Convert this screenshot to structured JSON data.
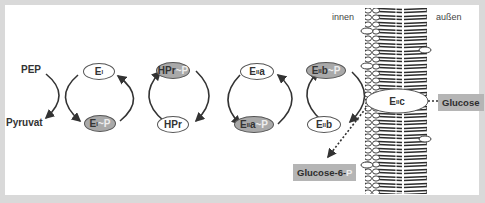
{
  "diagram": {
    "colors": {
      "frame": "#d9d9d9",
      "panel": "#ffffff",
      "phosphorylated_node": "#a9a9a9",
      "label_box": "#b5b5b5",
      "arrow": "#333333",
      "membrane": "#2b2b2b"
    },
    "substrates": {
      "pep": "PEP",
      "pyruvat": "Pyruvat"
    },
    "sides": {
      "inside": "innen",
      "outside": "außen"
    },
    "nodes": {
      "ei": {
        "base": "E",
        "sub": "I",
        "suffix": "",
        "p": ""
      },
      "ei_p": {
        "base": "E",
        "sub": "I",
        "suffix": "",
        "p": "~P"
      },
      "hpr_p": {
        "base": "HPr",
        "sub": "",
        "suffix": "",
        "p": "~P"
      },
      "hpr": {
        "base": "HPr",
        "sub": "",
        "suffix": "",
        "p": ""
      },
      "eiia": {
        "base": "E",
        "sub": "II",
        "suffix": "a",
        "p": ""
      },
      "eiia_p": {
        "base": "E",
        "sub": "II",
        "suffix": "a",
        "p": "~P"
      },
      "eiib_p": {
        "base": "E",
        "sub": "II",
        "suffix": "b",
        "p": "~P"
      },
      "eiib": {
        "base": "E",
        "sub": "II",
        "suffix": "b",
        "p": ""
      },
      "eiic": {
        "base": "E",
        "sub": "II",
        "suffix": "c",
        "p": ""
      }
    },
    "boxes": {
      "glucose": "Glucose",
      "glucose6p_base": "Glucose-6-",
      "glucose6p_p": "P"
    }
  }
}
